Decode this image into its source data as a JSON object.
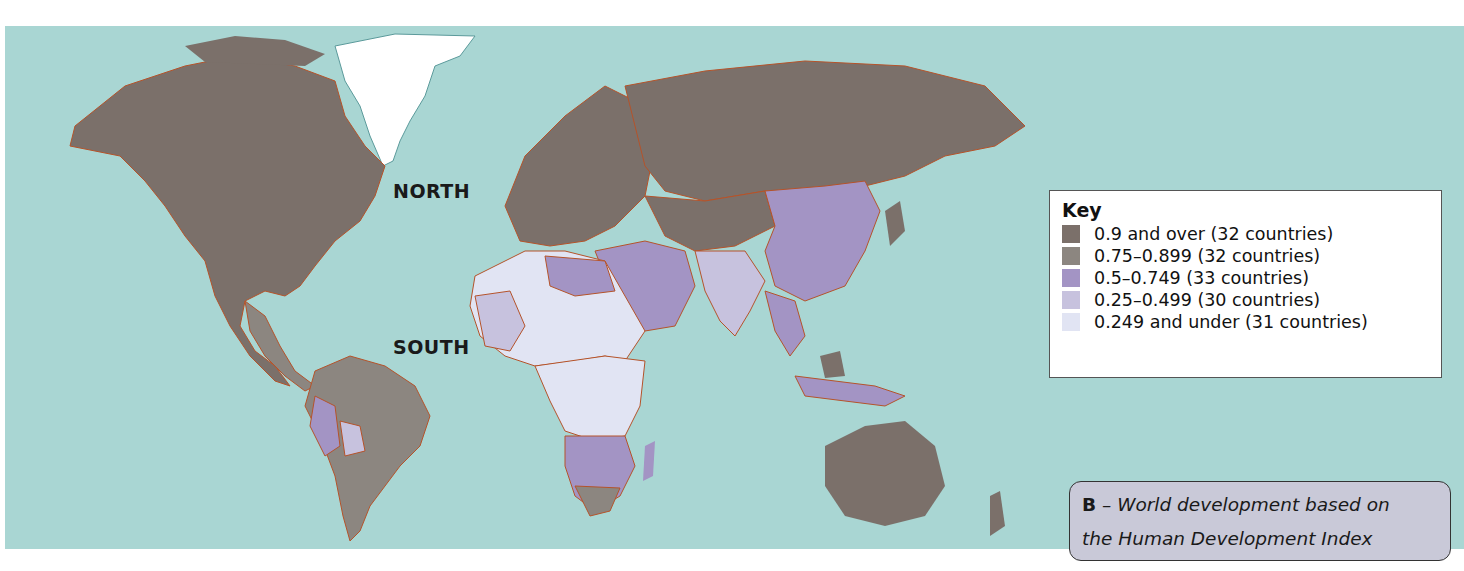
{
  "map": {
    "title": "World development based on the Human Development Index",
    "ocean_color": "#a9d6d3",
    "border_color": "#b5532a",
    "labels": {
      "north": "NORTH",
      "south": "SOUTH"
    }
  },
  "key": {
    "heading": "Key",
    "items": [
      {
        "label": "0.9 and over (32 countries)",
        "color": "#7b706a"
      },
      {
        "label": "0.75–0.899 (32 countries)",
        "color": "#8c8680"
      },
      {
        "label": "0.5–0.749 (33 countries)",
        "color": "#a394c4"
      },
      {
        "label": "0.25–0.499 (30 countries)",
        "color": "#c7c2de"
      },
      {
        "label": "0.249 and under (31 countries)",
        "color": "#e1e4f3"
      }
    ]
  },
  "caption": {
    "letter": "B",
    "dash": " – ",
    "line1": "World development based on",
    "line2": "the Human Development Index"
  }
}
